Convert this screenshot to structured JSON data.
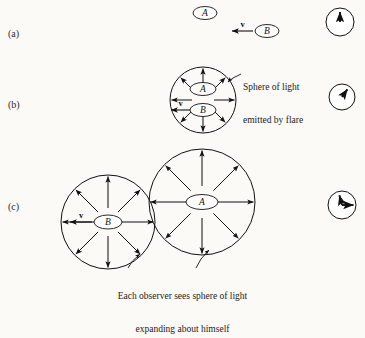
{
  "figure": {
    "background_color": "#fbfaf7",
    "ink_color": "#111111",
    "panels": [
      {
        "id": "a",
        "label": "(a)",
        "label_x": 8,
        "label_y": 36
      },
      {
        "id": "b",
        "label": "(b)",
        "label_x": 8,
        "label_y": 107
      },
      {
        "id": "c",
        "label": "(c)",
        "label_x": 8,
        "label_y": 209
      }
    ],
    "observers": {
      "a_label": "A",
      "b_label": "B"
    },
    "velocity_label": "v",
    "captions": [
      {
        "name": "sphere-of-light-caption",
        "line1": "Sphere of light",
        "line2": "emitted by flare",
        "x": 243,
        "y": 64
      },
      {
        "name": "each-observer-caption",
        "line1": "Each observer sees sphere of light",
        "line2": "expanding about himself",
        "x": 70,
        "y": 271
      }
    ],
    "panel_a": {
      "ellipse_a": {
        "cx": 205,
        "cy": 13,
        "rx": 12,
        "ry": 6.5
      },
      "ellipse_b": {
        "cx": 267,
        "cy": 31,
        "rx": 12,
        "ry": 6.5
      },
      "velocity_arrow": {
        "x_start": 253,
        "x_end": 232,
        "y": 31,
        "direction": "left"
      },
      "clock": {
        "cx": 340,
        "cy": 22,
        "r": 14,
        "hand_angle_deg": 0,
        "hand_count": 1
      }
    },
    "panel_b": {
      "circle": {
        "cx": 203,
        "cy": 100,
        "r": 33
      },
      "ellipse_a": {
        "cx": 203,
        "cy": 89,
        "rx": 13,
        "ry": 6.5
      },
      "ellipse_b": {
        "cx": 203,
        "cy": 110,
        "rx": 13,
        "ry": 6.5
      },
      "ray_count": 8,
      "velocity_arrow": {
        "x_start": 190,
        "x_end": 171,
        "y": 110,
        "direction": "left"
      },
      "clock": {
        "cx": 342,
        "cy": 97,
        "r": 13,
        "hand_angle_deg": 35,
        "hand_count": 1
      },
      "leader": {
        "from_x": 241,
        "from_y": 74,
        "to_x": 228,
        "to_y": 82
      }
    },
    "panel_c": {
      "circle_b": {
        "cx": 108,
        "cy": 222,
        "r": 47
      },
      "circle_a": {
        "cx": 202,
        "cy": 202,
        "r": 53
      },
      "ellipse_b": {
        "cx": 108,
        "cy": 222,
        "rx": 14,
        "ry": 7
      },
      "ellipse_a": {
        "cx": 202,
        "cy": 202,
        "rx": 16,
        "ry": 7.5
      },
      "ray_count": 8,
      "velocity_arrow": {
        "x_start": 92,
        "x_end": 70,
        "y": 222,
        "direction": "left"
      },
      "clock": {
        "cx": 342,
        "cy": 205,
        "r": 14,
        "hand_angle_deg": 345,
        "hand_count": 2
      },
      "leader_b": {
        "from_x": 128,
        "from_y": 268,
        "to_x": 140,
        "to_y": 254
      },
      "leader_a": {
        "from_x": 196,
        "from_y": 268,
        "to_x": 209,
        "to_y": 250
      }
    }
  }
}
